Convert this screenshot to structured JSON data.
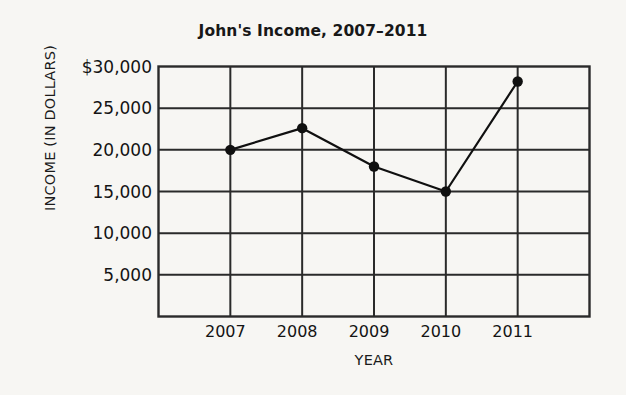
{
  "chart_data": {
    "type": "line",
    "title": "John's Income, 2007–2011",
    "xlabel": "YEAR",
    "ylabel": "INCOME (IN DOLLARS)",
    "categories": [
      "2007",
      "2008",
      "2009",
      "2010",
      "2011"
    ],
    "values": [
      20000,
      22600,
      18000,
      15000,
      28200
    ],
    "series": [
      {
        "name": "Income",
        "values": [
          20000,
          22600,
          18000,
          15000,
          28200
        ]
      }
    ],
    "ylim": [
      0,
      30000
    ],
    "ytick_values": [
      5000,
      10000,
      15000,
      20000,
      25000,
      30000
    ],
    "ytick_labels": [
      "5,000",
      "10,000",
      "15,000",
      "20,000",
      "25,000",
      "$30,000"
    ],
    "xtick_labels": [
      "2007",
      "2008",
      "2009",
      "2010",
      "2011"
    ],
    "grid": true,
    "legend": "none",
    "marker": "filled-circle",
    "line_color": "#101010",
    "grid_color": "#2a2a2a",
    "background_color": "#f7f6f3"
  }
}
